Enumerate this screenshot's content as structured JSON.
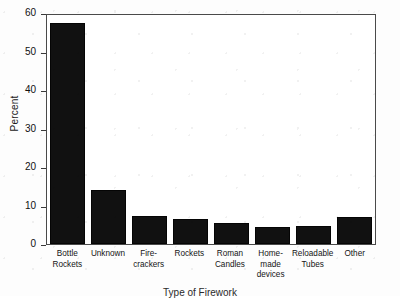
{
  "chart_data": {
    "type": "bar",
    "title": "",
    "xlabel": "Type of Firework",
    "ylabel": "Percent",
    "ylim": [
      0,
      60
    ],
    "yticks": [
      0,
      10,
      20,
      30,
      40,
      50,
      60
    ],
    "grid": false,
    "legend": null,
    "categories": [
      "Bottle Rockets",
      "Unknown",
      "Fire-crackers",
      "Rockets",
      "Roman Candles",
      "Home-made devices",
      "Reloadable Tubes",
      "Other"
    ],
    "category_lines": [
      [
        "Bottle",
        "Rockets"
      ],
      [
        "Unknown"
      ],
      [
        "Fire-",
        "crackers"
      ],
      [
        "Rockets"
      ],
      [
        "Roman",
        "Candles"
      ],
      [
        "Home-",
        "made",
        "devices"
      ],
      [
        "Reloadable",
        "Tubes"
      ],
      [
        "Other"
      ]
    ],
    "values": [
      58.0,
      14.2,
      7.4,
      6.5,
      5.5,
      4.5,
      4.7,
      7.2
    ],
    "bar_color": "#111111"
  },
  "axis": {
    "y_tick_labels": [
      "60",
      "50",
      "40",
      "30",
      "20",
      "10",
      "0"
    ],
    "y_title": "Percent",
    "x_title": "Type of Firework"
  }
}
